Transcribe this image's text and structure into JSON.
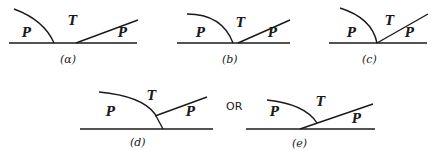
{
  "diagram": {
    "connector_text": "OR",
    "panels": [
      {
        "id": "a",
        "caption": "(α)",
        "left_region": "P",
        "middle_region": "T",
        "right_region": "P"
      },
      {
        "id": "b",
        "caption": "(b)",
        "left_region": "P",
        "middle_region": "T",
        "right_region": "P"
      },
      {
        "id": "c",
        "caption": "(c)",
        "left_region": "P",
        "middle_region": "T",
        "right_region": "P"
      },
      {
        "id": "d",
        "caption": "(d)",
        "left_region": "P",
        "middle_region": "T",
        "right_region": "P"
      },
      {
        "id": "e",
        "caption": "(e)",
        "left_region": "P",
        "middle_region": "T",
        "right_region": "P"
      }
    ]
  }
}
